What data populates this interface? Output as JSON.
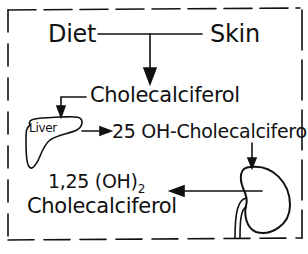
{
  "diagram": {
    "sources": {
      "left": "Diet",
      "right": "Skin"
    },
    "nodes": {
      "cholecalciferol": "Cholecalciferol",
      "liver": "Liver",
      "hydroxy25": "25 OH-Cholecalciferol",
      "dihydroxy_line1": "1,25 (OH)",
      "dihydroxy_sub": "2",
      "dihydroxy_line2": "Cholecalciferol"
    },
    "organs": [
      "liver",
      "kidney"
    ],
    "edges": [
      {
        "from": "Diet + Skin",
        "to": "Cholecalciferol"
      },
      {
        "from": "Cholecalciferol",
        "to": "Liver"
      },
      {
        "from": "Liver",
        "to": "25 OH-Cholecalciferol"
      },
      {
        "from": "25 OH-Cholecalciferol",
        "to": "Kidney"
      },
      {
        "from": "Kidney",
        "to": "1,25 (OH)2 Cholecalciferol"
      }
    ],
    "colors": {
      "ink": "#111111",
      "background": "#ffffff"
    }
  }
}
